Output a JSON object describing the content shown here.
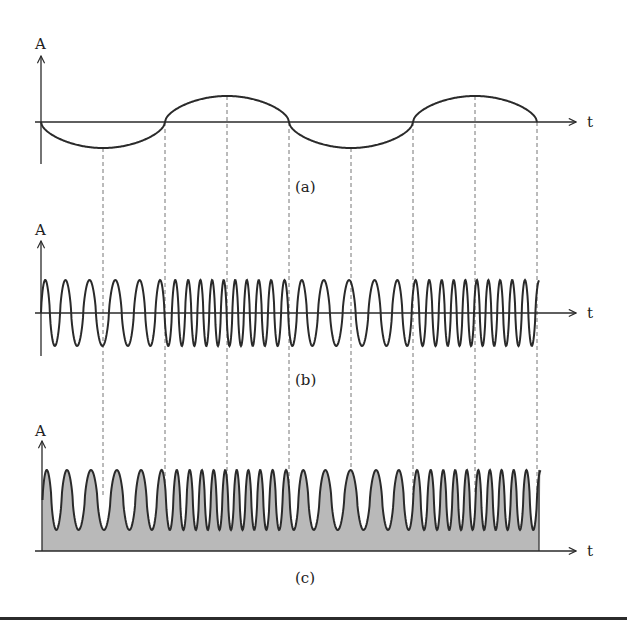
{
  "figure": {
    "colors": {
      "background": "#ffffff",
      "stroke": "#2a2a2a",
      "fill": "#b9b9b9",
      "dashed": "#777777"
    },
    "panels": [
      {
        "id": "a",
        "caption": "(a)",
        "y_axis_label": "A",
        "x_axis_label": "t"
      },
      {
        "id": "b",
        "caption": "(b)",
        "y_axis_label": "A",
        "x_axis_label": "t"
      },
      {
        "id": "c",
        "caption": "(c)",
        "y_axis_label": "A",
        "x_axis_label": "t"
      }
    ],
    "guide_lines_x": [
      103,
      165,
      227,
      289,
      351,
      413,
      475,
      537
    ],
    "signal": {
      "x_start": 41,
      "x_end": 537,
      "message_period_px": 248,
      "message_amplitude_px": 26,
      "carrier_min_period_px": 11.5,
      "carrier_max_period_px": 26
    }
  }
}
